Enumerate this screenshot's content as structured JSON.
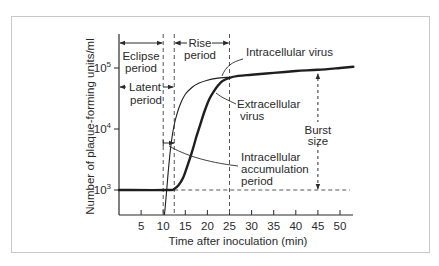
{
  "chart_data": {
    "type": "line",
    "title": "",
    "xlabel": "Time after inoculation (min)",
    "ylabel": "Number of plaque-forming units/ml",
    "xlim": [
      0,
      54
    ],
    "ylim_log10": [
      2.6,
      5.55
    ],
    "yscale": "log",
    "x_ticks": [
      5,
      10,
      15,
      20,
      25,
      30,
      35,
      40,
      45,
      50
    ],
    "x_tick_labels": [
      "5",
      "10",
      "15",
      "20",
      "25",
      "30",
      "35",
      "40",
      "45",
      "50"
    ],
    "y_ticks_log10": [
      3,
      4,
      5
    ],
    "y_tick_labels": [
      {
        "base": "10",
        "exp": "3"
      },
      {
        "base": "10",
        "exp": "4"
      },
      {
        "base": "10",
        "exp": "5"
      }
    ],
    "grid": false,
    "series": [
      {
        "name": "Extracellular virus",
        "style": "thick",
        "points_log10": [
          [
            0,
            3.0
          ],
          [
            11,
            3.0
          ],
          [
            12.5,
            3.02
          ],
          [
            13.5,
            3.08
          ],
          [
            14.5,
            3.2
          ],
          [
            15.5,
            3.4
          ],
          [
            16.5,
            3.62
          ],
          [
            17.5,
            3.87
          ],
          [
            18.5,
            4.1
          ],
          [
            19.5,
            4.32
          ],
          [
            20.5,
            4.5
          ],
          [
            21.5,
            4.62
          ],
          [
            22.5,
            4.72
          ],
          [
            23.5,
            4.79
          ],
          [
            25,
            4.84
          ],
          [
            27,
            4.87
          ],
          [
            30,
            4.89
          ],
          [
            35,
            4.92
          ],
          [
            40,
            4.95
          ],
          [
            45,
            4.97
          ],
          [
            50,
            5.0
          ],
          [
            53,
            5.02
          ]
        ]
      },
      {
        "name": "Intracellular virus",
        "style": "thin",
        "points_log10": [
          [
            10.3,
            2.6
          ],
          [
            10.8,
            3.0
          ],
          [
            11.2,
            3.35
          ],
          [
            11.7,
            3.7
          ],
          [
            12.3,
            4.0
          ],
          [
            13,
            4.22
          ],
          [
            14,
            4.43
          ],
          [
            15,
            4.57
          ],
          [
            16.5,
            4.68
          ],
          [
            18,
            4.75
          ],
          [
            20,
            4.8
          ],
          [
            22,
            4.83
          ],
          [
            25,
            4.85
          ]
        ]
      }
    ],
    "reference_lines": {
      "vertical_dashed_min": [
        10,
        12.5,
        25
      ],
      "horizontal_dashed_log10": 3.0,
      "horizontal_dashed_from_min": 12.5
    },
    "annotations": {
      "eclipse": {
        "line1": "Eclipse",
        "line2": "period",
        "from_min": 0,
        "to_min": 10
      },
      "latent": {
        "line1": "Latent",
        "line2": "period",
        "from_min": 0,
        "to_min": 12.5
      },
      "rise": {
        "line1": "Rise",
        "line2": "period",
        "from_min": 12.5,
        "to_min": 25
      },
      "intracellular_virus": "Intracellular virus",
      "extracellular": {
        "line1": "Extracellular",
        "line2": "virus"
      },
      "burst": {
        "line1": "Burst",
        "line2": "size",
        "at_min": 45,
        "from_log10": 3.0,
        "to_log10": 4.97
      },
      "accumulation": {
        "line1": "Intracellular",
        "line2": "accumulation",
        "line3": "period",
        "from_min": 10,
        "to_min": 12.5
      }
    }
  }
}
